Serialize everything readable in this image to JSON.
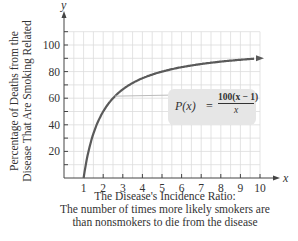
{
  "chart_data": {
    "type": "line",
    "title": "",
    "xlabel": "The Disease's Incidence Ratio:",
    "xlabel_sub": [
      "The number of times more likely smokers are",
      "than nonsmokers to die from the disease"
    ],
    "ylabel": [
      "Percentage of Deaths from the",
      "Disease That Are Smoking Related"
    ],
    "x_axis_symbol": "x",
    "y_axis_symbol": "y",
    "xlim": [
      0,
      10
    ],
    "ylim": [
      0,
      110
    ],
    "x_ticks": [
      1,
      2,
      3,
      4,
      5,
      6,
      7,
      8,
      9,
      10
    ],
    "y_ticks": [
      20,
      40,
      60,
      80,
      100
    ],
    "grid": true,
    "series": [
      {
        "name": "P(x) = 100(x - 1)/x",
        "x": [
          1,
          1.5,
          2,
          3,
          4,
          5,
          6,
          7,
          8,
          9,
          10
        ],
        "values": [
          0,
          33.3,
          50,
          66.7,
          75,
          80,
          83.3,
          85.7,
          87.5,
          88.9,
          90
        ],
        "color": "#5a5a5a"
      }
    ],
    "annotation": {
      "lhs": "P(x)",
      "eq": "=",
      "numerator": "100(x − 1)",
      "denominator": "x"
    }
  },
  "colors": {
    "curve": "#5a5a5a",
    "grid": "#dcdcdc",
    "axis": "#444444",
    "annotation_bg": "#e6e6e6"
  }
}
